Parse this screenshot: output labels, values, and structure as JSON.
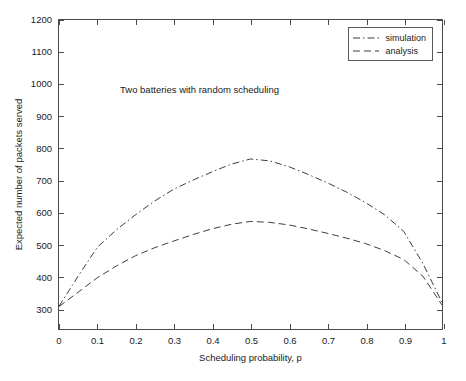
{
  "chart_data": {
    "type": "line",
    "title": "",
    "annotation": "Two batteries with random scheduling",
    "xlabel": "Scheduling probability, p",
    "ylabel": "Expected number of packets served",
    "xlim": [
      0,
      1
    ],
    "ylim": [
      235,
      1200
    ],
    "xticks": [
      0,
      0.1,
      0.2,
      0.3,
      0.4,
      0.5,
      0.6,
      0.7,
      0.8,
      0.9,
      1
    ],
    "xticklabels": [
      "0",
      "0.1",
      "0.2",
      "0.3",
      "0.4",
      "0.5",
      "0.6",
      "0.7",
      "0.8",
      "0.9",
      "1"
    ],
    "yticks": [
      300,
      400,
      500,
      600,
      700,
      800,
      900,
      1000,
      1100,
      1200
    ],
    "yticklabels": [
      "300",
      "400",
      "500",
      "600",
      "700",
      "800",
      "900",
      "1000",
      "1100",
      "1200"
    ],
    "grid": false,
    "legend_position": "top-right",
    "x": [
      0,
      0.05,
      0.1,
      0.15,
      0.2,
      0.25,
      0.3,
      0.35,
      0.4,
      0.45,
      0.5,
      0.55,
      0.6,
      0.65,
      0.7,
      0.75,
      0.8,
      0.85,
      0.9,
      0.95,
      1
    ],
    "series": [
      {
        "name": "simulation",
        "style": "dash-dot",
        "color": "#3c3c3c",
        "values": [
          306,
          400,
          490,
          545,
          592,
          635,
          672,
          700,
          726,
          750,
          766,
          760,
          742,
          718,
          692,
          663,
          630,
          592,
          540,
          440,
          318
        ]
      },
      {
        "name": "analysis",
        "style": "dashed",
        "color": "#3c3c3c",
        "values": [
          305,
          350,
          395,
          432,
          464,
          489,
          510,
          530,
          548,
          562,
          571,
          568,
          560,
          548,
          534,
          519,
          502,
          480,
          452,
          400,
          310
        ]
      }
    ]
  },
  "legend": {
    "entries": [
      {
        "label": "simulation",
        "style": "dash-dot"
      },
      {
        "label": "analysis",
        "style": "dashed"
      }
    ]
  }
}
